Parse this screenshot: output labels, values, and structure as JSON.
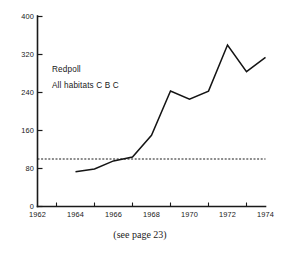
{
  "figure": {
    "caption": "(see page 23)",
    "annotations": {
      "line1": "Redpoll",
      "line2": "All  habitats C B C"
    }
  },
  "chart_data": {
    "type": "line",
    "title": "",
    "subtitle": "",
    "xlabel": "",
    "ylabel": "",
    "series_label": "Redpoll — All habitats C B C",
    "x": [
      1964,
      1965,
      1966,
      1967,
      1968,
      1969,
      1970,
      1971,
      1972,
      1973,
      1974
    ],
    "values": [
      73,
      79,
      96,
      104,
      150,
      243,
      226,
      243,
      340,
      284,
      314
    ],
    "reference_line": {
      "label": "",
      "value": 100,
      "style": "dashed",
      "x_start": 1962,
      "x_end": 1974
    },
    "xlim": [
      1962,
      1974
    ],
    "ylim": [
      0,
      400
    ],
    "xticks": [
      1962,
      1964,
      1966,
      1968,
      1970,
      1972,
      1974
    ],
    "xtick_labels": [
      "1962",
      "1964",
      "1966",
      "1968",
      "1970",
      "1972",
      "1974"
    ],
    "xminor_ticks": [
      1963,
      1965,
      1967,
      1969,
      1971,
      1973
    ],
    "yticks": [
      0,
      80,
      160,
      240,
      320,
      400
    ],
    "ytick_labels": [
      "0",
      "80",
      "160",
      "240",
      "320",
      "400"
    ],
    "grid": false,
    "legend": "none",
    "annotations": [
      "Redpoll",
      "All  habitats C B C"
    ]
  }
}
